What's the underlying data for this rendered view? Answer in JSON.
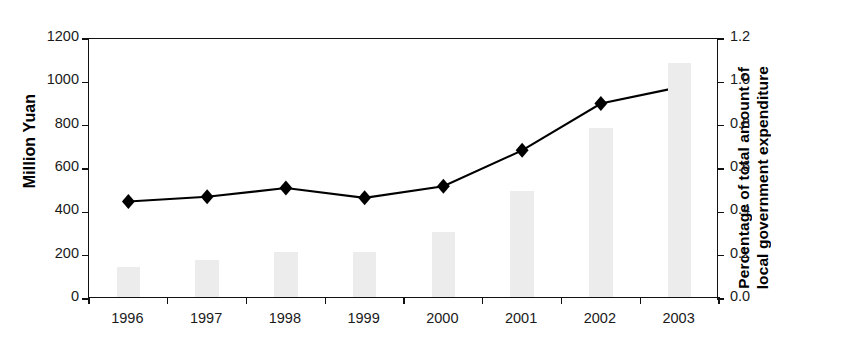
{
  "chart_data": {
    "type": "bar",
    "title": "",
    "subtitle": "",
    "xlabel": "",
    "categories": [
      "1996",
      "1997",
      "1998",
      "1999",
      "2000",
      "2001",
      "2002",
      "2003"
    ],
    "grid": false,
    "legend": "none",
    "annotations": [],
    "axes": {
      "left": {
        "label": "Million Yuan",
        "ylim": [
          0,
          1200
        ],
        "tick_step": 200,
        "ticks": [
          "0",
          "200",
          "400",
          "600",
          "800",
          "1000",
          "1200"
        ]
      },
      "right": {
        "label_line1": "Percentage of total amount of",
        "label_line2": "local government expenditure",
        "ylim": [
          0.0,
          1.2
        ],
        "tick_step": 0.2,
        "ticks": [
          "0.0",
          "0.2",
          "0.4",
          "0.6",
          "0.8",
          "1.0",
          "1.2"
        ]
      }
    },
    "series": [
      {
        "name": "Percentage of total amount of local government expenditure",
        "type": "bar",
        "axis": "right",
        "color": "#ececec",
        "values": [
          0.14,
          0.17,
          0.21,
          0.21,
          0.3,
          0.49,
          0.78,
          1.08
        ]
      },
      {
        "name": "Million Yuan",
        "type": "line",
        "axis": "left",
        "color": "#000000",
        "marker": "diamond",
        "values": [
          450,
          472,
          512,
          467,
          520,
          686,
          902,
          978
        ]
      }
    ]
  }
}
